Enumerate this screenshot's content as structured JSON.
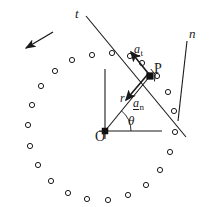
{
  "figure": {
    "colors": {
      "stroke": "#1a1a1a",
      "background": "#ffffff",
      "marker_fill": "#111111"
    },
    "labels": {
      "t_axis": "t",
      "n_axis": "n",
      "point_p": "P",
      "origin_o": "O",
      "radius": "r",
      "theta": "θ",
      "a_t_base": "a",
      "a_t_sub": "t",
      "a_n_base": "a",
      "a_n_sub": "n"
    },
    "geometry": {
      "origin": {
        "x": 105,
        "y": 131
      },
      "point_p": {
        "x": 150,
        "y": 76
      },
      "t_axis_line": {
        "x1": 86,
        "y1": 16,
        "x2": 186,
        "y2": 137
      },
      "n_axis_line": {
        "x1": 187,
        "y1": 41,
        "x2": 178,
        "y2": 121
      },
      "vertical_axis": {
        "x1": 105,
        "y1": 69,
        "x2": 105,
        "y2": 139
      },
      "horizontal_axis": {
        "x1": 99,
        "y1": 131,
        "x2": 162,
        "y2": 131
      },
      "radius_line": {
        "x1": 105,
        "y1": 131,
        "x2": 150,
        "y2": 76
      },
      "theta_arc_radius": 26,
      "a_t_arrow": {
        "x1": 152,
        "y1": 78,
        "x2": 131,
        "y2": 52
      },
      "a_n_arrow": {
        "x1": 148,
        "y1": 74,
        "x2": 126,
        "y2": 100
      },
      "direction_arrow": {
        "x1": 53,
        "y1": 32,
        "x2": 26,
        "y2": 48
      },
      "right_angle_marker": {
        "x": 150,
        "y": 76,
        "size": 7
      },
      "dot_ring": {
        "center": {
          "x": 103,
          "y": 130
        },
        "radius": 76,
        "count": 24,
        "dot_radius": 2.6,
        "start_angle_deg": 98
      }
    },
    "dot_ring_points": [
      {
        "x": 92,
        "y": 55
      },
      {
        "x": 72,
        "y": 60
      },
      {
        "x": 55,
        "y": 71
      },
      {
        "x": 41,
        "y": 86
      },
      {
        "x": 32,
        "y": 105
      },
      {
        "x": 28,
        "y": 125
      },
      {
        "x": 30,
        "y": 146
      },
      {
        "x": 38,
        "y": 165
      },
      {
        "x": 51,
        "y": 181
      },
      {
        "x": 68,
        "y": 193
      },
      {
        "x": 87,
        "y": 199
      },
      {
        "x": 108,
        "y": 200
      },
      {
        "x": 128,
        "y": 195
      },
      {
        "x": 146,
        "y": 185
      },
      {
        "x": 160,
        "y": 170
      },
      {
        "x": 170,
        "y": 152
      },
      {
        "x": 175,
        "y": 132
      },
      {
        "x": 174,
        "y": 111
      },
      {
        "x": 168,
        "y": 92
      },
      {
        "x": 157,
        "y": 76
      },
      {
        "x": 142,
        "y": 63
      },
      {
        "x": 130,
        "y": 56
      },
      {
        "x": 112,
        "y": 53
      }
    ]
  }
}
